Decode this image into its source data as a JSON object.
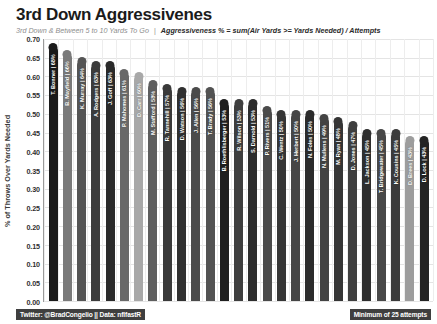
{
  "header": {
    "title": "3rd Down Aggressivenes",
    "subtitle_main": "3rd Down & Between 5 to 10 Yards To Go",
    "subtitle_separator": "|",
    "subtitle_formula": "Aggressiveness % = sum(Air Yards >= Yards Needed) / Attempts"
  },
  "footer": {
    "credit": "Twitter: @BradCongelio || Data: nflfastR",
    "note": "Minimum of 25 attempts"
  },
  "colors": {
    "title": "#1b1b1b",
    "subtitle": "#8e8e8e",
    "formula": "#2b2b2b",
    "grid": "#e4e4e4",
    "axis": "#9a9a9a",
    "footer_bg": "#3f3f3f",
    "footer_text": "#ffffff",
    "bar_label": "#ffffff"
  },
  "chart_data": {
    "type": "bar",
    "title": "3rd Down Aggressivenes",
    "subtitle": "3rd Down & Between 5 to 10 Yards To Go | Aggressiveness % = sum(Air Yards >= Yards Needed) / Attempts",
    "xlabel": "",
    "ylabel": "% of Throws Over Yards Needed",
    "ylim": [
      0.0,
      0.7
    ],
    "ytick_labels": [
      "0.70",
      "0.65",
      "0.60",
      "0.55",
      "0.50",
      "0.45",
      "0.40",
      "0.35",
      "0.30",
      "0.25",
      "0.20",
      "0.15",
      "0.10",
      "0.05",
      "0.00"
    ],
    "ytick_values": [
      0.7,
      0.65,
      0.6,
      0.55,
      0.5,
      0.45,
      0.4,
      0.35,
      0.3,
      0.25,
      0.2,
      0.15,
      0.1,
      0.05,
      0.0
    ],
    "grid": true,
    "legend": "none",
    "annotation": "Minimum of 25 attempts",
    "categories": [
      "T. Bonner",
      "B. Mayfield",
      "K. Murray",
      "A. Rodgers",
      "J. Goff",
      "P. Mahomes",
      "D. Carr",
      "M. Stafford",
      "R. Tannehill",
      "D. Watson",
      "J. Allen",
      "T. Brady",
      "B. Roethlisberger",
      "R. Wilson",
      "S. Darnold",
      "P. Rivers",
      "C. Wentz",
      "J. Herbert",
      "N. Foles",
      "N. Mullens",
      "M. Ryan",
      "D. Jones",
      "L. Jackson",
      "T. Bridgewater",
      "K. Cousins",
      "D. Brees",
      "D. Lock"
    ],
    "values": [
      0.68,
      0.66,
      0.64,
      0.63,
      0.63,
      0.61,
      0.6,
      0.58,
      0.57,
      0.56,
      0.56,
      0.56,
      0.53,
      0.53,
      0.53,
      0.51,
      0.5,
      0.5,
      0.5,
      0.49,
      0.48,
      0.47,
      0.45,
      0.45,
      0.45,
      0.43,
      0.43
    ],
    "bars": [
      {
        "label": "T. Bonner | 68%",
        "name": "T. Bonner",
        "pct": "68%",
        "value": 0.68,
        "color": "#1a1a1a"
      },
      {
        "label": "B. Mayfield | 66%",
        "name": "B. Mayfield",
        "pct": "66%",
        "value": 0.66,
        "color": "#7a7a7a"
      },
      {
        "label": "K. Murray | 64%",
        "name": "K. Murray",
        "pct": "64%",
        "value": 0.64,
        "color": "#555555"
      },
      {
        "label": "A. Rodgers | 63%",
        "name": "A. Rodgers",
        "pct": "63%",
        "value": 0.63,
        "color": "#3c3c3c"
      },
      {
        "label": "J. Goff | 63%",
        "name": "J. Goff",
        "pct": "63%",
        "value": 0.63,
        "color": "#2a2a2a"
      },
      {
        "label": "P. Mahomes | 61%",
        "name": "P. Mahomes",
        "pct": "61%",
        "value": 0.61,
        "color": "#696969"
      },
      {
        "label": "D. Carr | 60%",
        "name": "D. Carr",
        "pct": "60%",
        "value": 0.6,
        "color": "#a8a8a8"
      },
      {
        "label": "M. Stafford | 58%",
        "name": "M. Stafford",
        "pct": "58%",
        "value": 0.58,
        "color": "#5e5e5e"
      },
      {
        "label": "R. Tannehill | 57%",
        "name": "R. Tannehill",
        "pct": "57%",
        "value": 0.57,
        "color": "#3a3a3a"
      },
      {
        "label": "D. Watson | 56%",
        "name": "D. Watson",
        "pct": "56%",
        "value": 0.56,
        "color": "#303030"
      },
      {
        "label": "J. Allen | 56%",
        "name": "J. Allen",
        "pct": "56%",
        "value": 0.56,
        "color": "#4b4b4b"
      },
      {
        "label": "T. Brady | 56%",
        "name": "T. Brady",
        "pct": "56%",
        "value": 0.56,
        "color": "#525252"
      },
      {
        "label": "B. Roethlisberger | 53%",
        "name": "B. Roethlisberger",
        "pct": "53%",
        "value": 0.53,
        "color": "#1f1f1f"
      },
      {
        "label": "R. Wilson | 53%",
        "name": "R. Wilson",
        "pct": "53%",
        "value": 0.53,
        "color": "#3e3e3e"
      },
      {
        "label": "S. Darnold | 53%",
        "name": "S. Darnold",
        "pct": "53%",
        "value": 0.53,
        "color": "#2d2d2d"
      },
      {
        "label": "P. Rivers | 51%",
        "name": "P. Rivers",
        "pct": "51%",
        "value": 0.51,
        "color": "#4a4a4a"
      },
      {
        "label": "C. Wentz | 50%",
        "name": "C. Wentz",
        "pct": "50%",
        "value": 0.5,
        "color": "#363636"
      },
      {
        "label": "J. Herbert | 50%",
        "name": "J. Herbert",
        "pct": "50%",
        "value": 0.5,
        "color": "#464646"
      },
      {
        "label": "N. Foles | 50%",
        "name": "N. Foles",
        "pct": "50%",
        "value": 0.5,
        "color": "#2b2b2b"
      },
      {
        "label": "N. Mullens | 49%",
        "name": "N. Mullens",
        "pct": "49%",
        "value": 0.49,
        "color": "#434343"
      },
      {
        "label": "M. Ryan | 48%",
        "name": "M. Ryan",
        "pct": "48%",
        "value": 0.48,
        "color": "#353535"
      },
      {
        "label": "D. Jones | 47%",
        "name": "D. Jones",
        "pct": "47%",
        "value": 0.47,
        "color": "#3f3f3f"
      },
      {
        "label": "L. Jackson | 45%",
        "name": "L. Jackson",
        "pct": "45%",
        "value": 0.45,
        "color": "#2e2e2e"
      },
      {
        "label": "T. Bridgewater | 45%",
        "name": "T. Bridgewater",
        "pct": "45%",
        "value": 0.45,
        "color": "#484848"
      },
      {
        "label": "K. Cousins | 45%",
        "name": "K. Cousins",
        "pct": "45%",
        "value": 0.45,
        "color": "#3b3b3b"
      },
      {
        "label": "D. Brees | 43%",
        "name": "D. Brees",
        "pct": "43%",
        "value": 0.43,
        "color": "#9d9d9d"
      },
      {
        "label": "D. Lock | 43%",
        "name": "D. Lock",
        "pct": "43%",
        "value": 0.43,
        "color": "#242424"
      }
    ]
  }
}
